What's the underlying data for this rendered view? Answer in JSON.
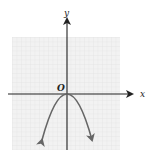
{
  "figure": {
    "axis_labels": {
      "x": "x",
      "y": "y",
      "origin": "O"
    },
    "colors": {
      "grid_background": "#f1f1f1",
      "grid_line": "#e0e0e0",
      "axis": "#222222",
      "curve": "#666666"
    },
    "curve": {
      "type": "parabola",
      "vertex": [
        0,
        0
      ],
      "opens": "down",
      "arrows_at_ends": true
    }
  }
}
